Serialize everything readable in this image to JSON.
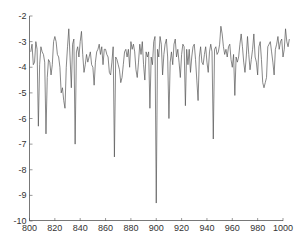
{
  "chart_data": {
    "type": "line",
    "title": "",
    "xlabel": "",
    "ylabel": "",
    "xlim": [
      800,
      1000
    ],
    "ylim": [
      -10,
      -2
    ],
    "grid": false,
    "legend": null,
    "x_ticks": [
      "800",
      "820",
      "840",
      "860",
      "880",
      "900",
      "920",
      "940",
      "960",
      "980",
      "1000"
    ],
    "y_ticks": [
      "-2",
      "-3",
      "-4",
      "-5",
      "-6",
      "-7",
      "-8",
      "-9",
      "-10"
    ],
    "line_color": "#555555",
    "series": [
      {
        "name": "signal",
        "x_start": 801,
        "x_step": 1,
        "values": [
          -3.4,
          -3.1,
          -3.9,
          -3.8,
          -3.0,
          -3.3,
          -6.3,
          -3.9,
          -3.2,
          -3.4,
          -3.5,
          -3.8,
          -6.6,
          -4.4,
          -3.7,
          -3.8,
          -4.3,
          -3.9,
          -3.0,
          -2.8,
          -3.0,
          -3.5,
          -3.6,
          -4.0,
          -5.0,
          -4.8,
          -5.3,
          -5.6,
          -4.0,
          -3.2,
          -2.5,
          -3.6,
          -4.8,
          -3.1,
          -2.9,
          -7.0,
          -3.4,
          -3.2,
          -3.6,
          -3.0,
          -2.6,
          -3.5,
          -4.2,
          -3.9,
          -3.5,
          -3.8,
          -3.6,
          -3.4,
          -3.9,
          -4.0,
          -4.7,
          -3.8,
          -3.4,
          -3.3,
          -3.1,
          -3.5,
          -3.2,
          -3.9,
          -3.3,
          -3.3,
          -3.5,
          -3.6,
          -4.2,
          -4.3,
          -3.8,
          -3.2,
          -7.5,
          -3.6,
          -3.7,
          -3.9,
          -4.1,
          -4.6,
          -4.4,
          -3.9,
          -3.4,
          -3.3,
          -3.6,
          -3.3,
          -4.0,
          -3.0,
          -3.3,
          -3.1,
          -3.4,
          -4.1,
          -4.4,
          -3.8,
          -3.1,
          -3.5,
          -3.0,
          -3.9,
          -4.5,
          -3.4,
          -3.6,
          -3.4,
          -5.6,
          -3.6,
          -3.9,
          -3.0,
          -2.8,
          -9.3,
          -3.3,
          -3.6,
          -2.8,
          -3.1,
          -4.3,
          -3.5,
          -3.1,
          -2.9,
          -3.6,
          -6.0,
          -3.8,
          -3.4,
          -3.9,
          -3.1,
          -2.9,
          -3.6,
          -3.3,
          -3.8,
          -4.4,
          -3.5,
          -3.1,
          -3.2,
          -5.5,
          -3.3,
          -3.9,
          -3.3,
          -4.2,
          -3.6,
          -3.2,
          -3.1,
          -3.7,
          -4.5,
          -5.3,
          -3.6,
          -3.2,
          -3.8,
          -3.9,
          -3.5,
          -3.2,
          -3.8,
          -4.2,
          -3.4,
          -3.1,
          -3.4,
          -6.8,
          -3.3,
          -3.2,
          -3.5,
          -3.4,
          -3.1,
          -2.4,
          -2.7,
          -3.2,
          -3.5,
          -3.3,
          -3.6,
          -3.2,
          -3.1,
          -3.7,
          -4.0,
          -3.5,
          -5.1,
          -3.6,
          -3.8,
          -3.6,
          -3.1,
          -2.7,
          -3.2,
          -3.8,
          -4.2,
          -3.6,
          -2.8,
          -3.5,
          -4.1,
          -3.7,
          -3.3,
          -2.7,
          -3.6,
          -3.8,
          -4.3,
          -3.2,
          -3.0,
          -3.7,
          -4.6,
          -4.8,
          -4.6,
          -4.4,
          -3.2,
          -3.1,
          -3.0,
          -3.4,
          -3.8,
          -4.3,
          -3.3,
          -3.1,
          -2.8,
          -3.3,
          -3.0,
          -2.9,
          -3.6,
          -3.3,
          -2.5,
          -3.0,
          -3.2,
          -2.9
        ]
      }
    ]
  }
}
